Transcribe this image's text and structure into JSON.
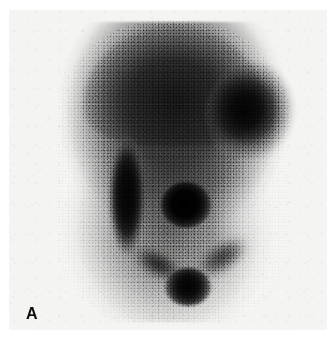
{
  "figure": {
    "domain": "medical-scintigraphy",
    "panel_label": "A",
    "modality_name": "scintigram",
    "background_color": "#ffffff",
    "plate_color": "#f4f4f3",
    "activity_color": "#000000"
  },
  "plate": {
    "name": "photographic-print",
    "x": 9,
    "y": 10,
    "width": 318,
    "height": 320
  },
  "features": [
    {
      "id": "uptake-body",
      "label": "diffuse-uptake-field",
      "intensity": "moderate"
    },
    {
      "id": "uptake-dome-cap",
      "label": "superior-dome-border",
      "intensity": "moderate-high"
    },
    {
      "id": "focus-upper-right",
      "label": "dense-focus-upper-right",
      "intensity": "very-high"
    },
    {
      "id": "band-left-vertical",
      "label": "elongated-vertical-band-left",
      "intensity": "very-high"
    },
    {
      "id": "focus-central",
      "label": "central-focal-hot-spot",
      "intensity": "maximal"
    },
    {
      "id": "focus-inferior",
      "label": "inferior-midline-hot-spot",
      "intensity": "very-high"
    },
    {
      "id": "tract-left-oblique",
      "label": "left-oblique-tract",
      "intensity": "moderate"
    },
    {
      "id": "tract-right-oblique",
      "label": "right-oblique-tract",
      "intensity": "moderate"
    },
    {
      "id": "photopenic-right",
      "label": "photopenic-zone-right",
      "intensity": "low"
    }
  ]
}
